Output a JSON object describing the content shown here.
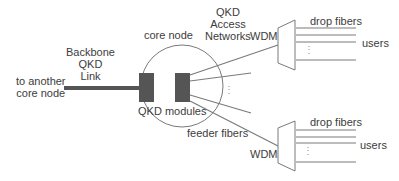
{
  "labels": {
    "backbone": [
      "Backbone",
      "QKD",
      "Link"
    ],
    "to_core": [
      "to another",
      "core node"
    ],
    "core_node": "core node",
    "access": [
      "QKD",
      "Access",
      "Networks"
    ],
    "qkd_modules": "QKD modules",
    "feeder_fibers": "feeder fibers",
    "wdm_top": "WDM",
    "wdm_bottom": "WDM",
    "drop_fibers_top": "drop fibers",
    "drop_fibers_bottom": "drop fibers",
    "users_top": "users",
    "users_bottom": "users",
    "ellipsis": "⋮"
  },
  "colors": {
    "line": "#7a7a7a",
    "module": "#555555",
    "text": "#3c3c3c"
  }
}
